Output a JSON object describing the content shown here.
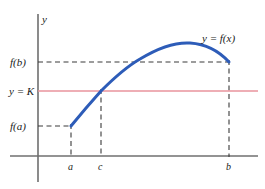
{
  "figure": {
    "background": "#ffffff",
    "width": 265,
    "height": 189
  },
  "axes": {
    "y_axis_label": "y",
    "x_axis_label": "",
    "origin_px": {
      "x": 38,
      "y": 156
    },
    "x_axis_extent_px": {
      "x1": 10,
      "x2": 258
    },
    "y_axis_extent_px": {
      "y1": 14,
      "y2": 182
    }
  },
  "colors": {
    "curve": "#2d5cb8",
    "level_line": "#e8939d",
    "axis": "#6f6f6f",
    "dashed": "#3a3a3a",
    "text": "#1a1a1a"
  },
  "labels": {
    "curve": "y = f(x)",
    "level": "y = K",
    "f_of_b": "f(b)",
    "f_of_a": "f(a)",
    "tick_a": "a",
    "tick_c": "c",
    "tick_b": "b"
  },
  "chart_data": {
    "type": "line",
    "title": "",
    "xlabel": "",
    "ylabel": "y",
    "grid": false,
    "legend": "inline-annotation",
    "annotations": [
      {
        "text": "y = f(x)",
        "x_px": 226,
        "y_px": 38
      },
      {
        "text": "y = K",
        "x_px": 24,
        "y_px": 91
      },
      {
        "text": "f(b)",
        "x_px": 24,
        "y_px": 62
      },
      {
        "text": "f(a)",
        "x_px": 24,
        "y_px": 126
      }
    ],
    "x_ticks": [
      {
        "label": "a",
        "x_px": 71
      },
      {
        "label": "c",
        "x_px": 101
      },
      {
        "label": "b",
        "x_px": 229
      }
    ],
    "y_ticks": [
      {
        "label": "f(b)",
        "y_px": 62
      },
      {
        "label": "y = K",
        "y_px": 91
      },
      {
        "label": "f(a)",
        "y_px": 126
      }
    ],
    "series": [
      {
        "name": "y = f(x)",
        "color": "#2d5cb8",
        "points_px": [
          {
            "x": 71,
            "y": 126
          },
          {
            "x": 86,
            "y": 108
          },
          {
            "x": 101,
            "y": 91
          },
          {
            "x": 118,
            "y": 76
          },
          {
            "x": 136,
            "y": 64
          },
          {
            "x": 155,
            "y": 54
          },
          {
            "x": 172,
            "y": 47
          },
          {
            "x": 190,
            "y": 43
          },
          {
            "x": 206,
            "y": 45
          },
          {
            "x": 219,
            "y": 52
          },
          {
            "x": 229,
            "y": 62
          }
        ]
      },
      {
        "name": "y = K",
        "color": "#e8939d",
        "type": "horizontal-line",
        "y_px": 91,
        "x_from_px": 38,
        "x_to_px": 258
      }
    ],
    "dashed_guides": [
      {
        "name": "f(b)-horizontal",
        "x1": 38,
        "y1": 62,
        "x2": 229,
        "y2": 62
      },
      {
        "name": "f(a)-horizontal",
        "x1": 38,
        "y1": 126,
        "x2": 71,
        "y2": 126
      },
      {
        "name": "a-vertical",
        "x1": 71,
        "y1": 126,
        "x2": 71,
        "y2": 156
      },
      {
        "name": "c-vertical",
        "x1": 101,
        "y1": 91,
        "x2": 101,
        "y2": 156
      },
      {
        "name": "b-vertical",
        "x1": 229,
        "y1": 62,
        "x2": 229,
        "y2": 156
      }
    ]
  }
}
